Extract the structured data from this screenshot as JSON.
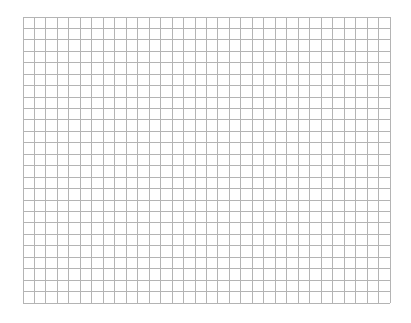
{
  "page": {
    "background_color": "#ffffff",
    "content": "blank grid paper"
  },
  "grid": {
    "columns": 32,
    "rows": 25,
    "line_color": "#b4b4b4"
  }
}
